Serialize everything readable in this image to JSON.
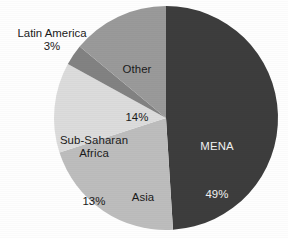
{
  "chart_data": {
    "type": "pie",
    "title": "",
    "subtitle": "",
    "xlabel": "",
    "ylabel": "",
    "legend_position": "none",
    "grid": false,
    "start_angle_deg": 0,
    "direction": "clockwise",
    "categories": [
      "MENA",
      "Asia",
      "Sub-Saharan Africa",
      "Latin America",
      "Other"
    ],
    "values": [
      49,
      21,
      13,
      3,
      14
    ],
    "value_suffix": "%",
    "slices": [
      {
        "name": "MENA",
        "value": 49,
        "label": "MENA",
        "percent_text": "49%",
        "color": "#3d3d3d",
        "label_color": "#f2f2f2",
        "label_placement": "inside"
      },
      {
        "name": "Asia",
        "value": 21,
        "label": "Asia",
        "percent_text": "21%",
        "color": "#bdbdbd",
        "label_color": "#1a1a1a",
        "label_placement": "inside"
      },
      {
        "name": "Sub-Saharan Africa",
        "value": 13,
        "label": "Sub-Saharan\nAfrica",
        "percent_text": "13%",
        "color": "#dcdcdc",
        "label_color": "#1a1a1a",
        "label_placement": "inside"
      },
      {
        "name": "Latin America",
        "value": 3,
        "label": "Latin America",
        "percent_text": "3%",
        "color": "#828282",
        "label_color": "#1a1a1a",
        "label_placement": "outside"
      },
      {
        "name": "Other",
        "value": 14,
        "label": "Other",
        "percent_text": "14%",
        "color": "#9a9a9a",
        "label_color": "#1a1a1a",
        "label_placement": "inside"
      }
    ],
    "background_color": "#ffffff"
  }
}
